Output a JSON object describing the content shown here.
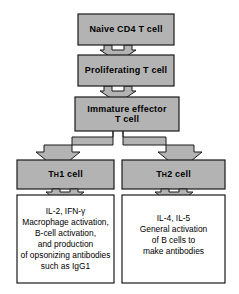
{
  "diagram": {
    "background_color": "#ffffff",
    "box_fill_color": "#b3b3b3",
    "box_border_color": "#1a1a1a",
    "arrow_fill_color": "#b3b3b3",
    "arrow_border_color": "#1a1a1a",
    "outcome_box_fill_color": "#ffffff",
    "nodes": {
      "naive": "Naive  CD4  T  cell",
      "proliferating": "Proliferating  T  cell",
      "immature": "Immature  effector\nT cell",
      "th1_prefix": "T",
      "th1_sub": "H",
      "th1_suffix": "1  cell",
      "th2_prefix": "T",
      "th2_sub": "H",
      "th2_suffix": "2  cell"
    },
    "outcomes": {
      "th1_text": "IL-2, IFN-γ\nMacrophage activation,\nB-cell activation,\nand production\nof opsonizing antibodies\nsuch as IgG1",
      "th2_text": "IL-4, IL-5\nGeneral activation\nof B cells to\nmake antibodies"
    }
  }
}
